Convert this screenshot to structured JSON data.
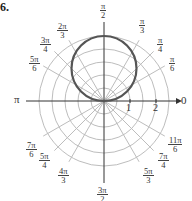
{
  "problem_number": "6.",
  "chart_data": {
    "type": "line",
    "subtype": "polar",
    "title": "",
    "curve": {
      "description": "circle through pole, tangent to polar axis, centered on θ=π/2 ray",
      "equation_estimate": "r = 2.5 sin θ",
      "diameter": 2.5,
      "color": "#555555"
    },
    "radial_ticks": [
      1,
      2
    ],
    "radial_grid": [
      0.5,
      1,
      1.5,
      2,
      2.5
    ],
    "rmax": 2.7,
    "angle_labels": [
      {
        "angle": "0",
        "value_deg": 0
      },
      {
        "angle": "π/6",
        "value_deg": 30
      },
      {
        "angle": "π/4",
        "value_deg": 45
      },
      {
        "angle": "π/3",
        "value_deg": 60
      },
      {
        "angle": "π/2",
        "value_deg": 90
      },
      {
        "angle": "2π/3",
        "value_deg": 120
      },
      {
        "angle": "3π/4",
        "value_deg": 135
      },
      {
        "angle": "5π/6",
        "value_deg": 150
      },
      {
        "angle": "π",
        "value_deg": 180
      },
      {
        "angle": "7π/6",
        "value_deg": 210
      },
      {
        "angle": "5π/4",
        "value_deg": 225
      },
      {
        "angle": "4π/3",
        "value_deg": 240
      },
      {
        "angle": "3π/2",
        "value_deg": 270
      },
      {
        "angle": "5π/3",
        "value_deg": 300
      },
      {
        "angle": "7π/4",
        "value_deg": 315
      },
      {
        "angle": "11π/6",
        "value_deg": 330
      }
    ],
    "xlabel": "",
    "ylabel": "",
    "grid": true
  },
  "labels": {
    "pi": "π",
    "zero": "0",
    "tick1": "1",
    "tick2": "2",
    "a90": {
      "n": "π",
      "d": "2"
    },
    "a60": {
      "n": "π",
      "d": "3"
    },
    "a45": {
      "n": "π",
      "d": "4"
    },
    "a30": {
      "n": "π",
      "d": "6"
    },
    "a120": {
      "n": "2π",
      "d": "3"
    },
    "a135": {
      "n": "3π",
      "d": "4"
    },
    "a150": {
      "n": "5π",
      "d": "6"
    },
    "a210": {
      "n": "7π",
      "d": "6"
    },
    "a225": {
      "n": "5π",
      "d": "4"
    },
    "a240": {
      "n": "4π",
      "d": "3"
    },
    "a270": {
      "n": "3π",
      "d": "2"
    },
    "a300": {
      "n": "5π",
      "d": "3"
    },
    "a315": {
      "n": "7π",
      "d": "4"
    },
    "a330": {
      "n": "11π",
      "d": "6"
    }
  }
}
